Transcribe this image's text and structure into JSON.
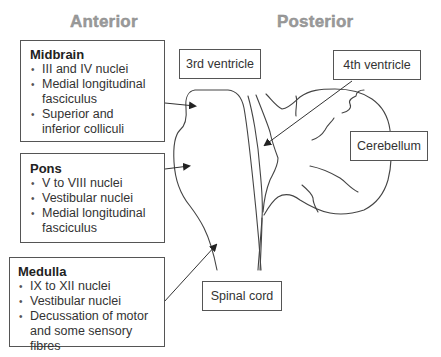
{
  "headings": {
    "anterior": "Anterior",
    "posterior": "Posterior"
  },
  "regions": {
    "midbrain": {
      "title": "Midbrain",
      "items": [
        "III and IV nuclei",
        "Medial longitudinal",
        "fasciculus",
        "Superior and",
        "inferior colliculi"
      ],
      "bullets": [
        {
          "line1": "III and IV nuclei",
          "line2": ""
        },
        {
          "line1": "Medial longitudinal",
          "line2": "fasciculus"
        },
        {
          "line1": "Superior and",
          "line2": "inferior colliculi"
        }
      ]
    },
    "pons": {
      "title": "Pons",
      "bullets": [
        {
          "line1": "V to VIII nuclei",
          "line2": ""
        },
        {
          "line1": "Vestibular nuclei",
          "line2": ""
        },
        {
          "line1": "Medial longitudinal",
          "line2": "fasciculus"
        }
      ]
    },
    "medulla": {
      "title": "Medulla",
      "bullets": [
        {
          "line1": "IX to XII nuclei",
          "line2": ""
        },
        {
          "line1": "Vestibular nuclei",
          "line2": ""
        },
        {
          "line1": "Decussation of motor",
          "line2": "and some sensory fibres"
        }
      ]
    }
  },
  "labels": {
    "third_ventricle": "3rd ventricle",
    "fourth_ventricle": "4th ventricle",
    "cerebellum": "Cerebellum",
    "spinal_cord": "Spinal cord"
  }
}
